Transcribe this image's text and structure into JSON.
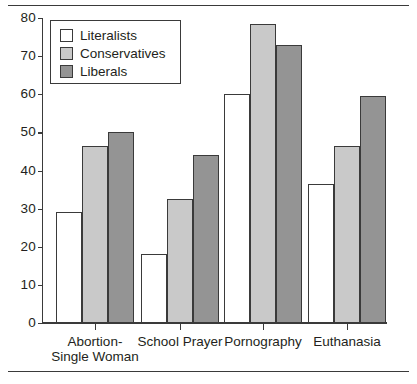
{
  "chart_data": {
    "type": "bar",
    "title": "",
    "subtitle": "",
    "xlabel": "",
    "ylabel": "",
    "ylim": [
      0,
      80
    ],
    "yticks": [
      0,
      10,
      20,
      30,
      40,
      50,
      60,
      70,
      80
    ],
    "grid": false,
    "legend_position": "top-left",
    "categories": [
      "Abortion-\nSingle Woman",
      "School Prayer",
      "Pornography",
      "Euthanasia"
    ],
    "category_lines": [
      [
        "Abortion-",
        "Single Woman"
      ],
      [
        "School Prayer"
      ],
      [
        "Pornography"
      ],
      [
        "Euthanasia"
      ]
    ],
    "series": [
      {
        "name": "Literalists",
        "color": "#ffffff",
        "values": [
          29,
          18,
          60,
          36.5
        ]
      },
      {
        "name": "Conservatives",
        "color": "#c9c9c9",
        "values": [
          46.5,
          32.5,
          78.5,
          46.5
        ]
      },
      {
        "name": "Liberals",
        "color": "#949494",
        "values": [
          50,
          44,
          73,
          59.5
        ]
      }
    ]
  },
  "legend": {
    "items": [
      {
        "label": "Literalists",
        "swatch": "literalists"
      },
      {
        "label": "Conservatives",
        "swatch": "conservatives"
      },
      {
        "label": "Liberals",
        "swatch": "liberals"
      }
    ]
  },
  "colors": {
    "literalists": "#ffffff",
    "conservatives": "#c9c9c9",
    "liberals": "#949494",
    "outline": "#3a3a3a",
    "text": "#231f20",
    "background": "#ffffff"
  }
}
